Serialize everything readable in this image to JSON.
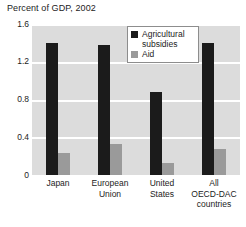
{
  "chart_data": {
    "type": "bar",
    "title": "Percent of GDP, 2002",
    "xlabel": "",
    "ylabel": "",
    "ylim": [
      0,
      1.6
    ],
    "yticks": [
      "0",
      "0.4",
      "0.8",
      "1.2",
      "1.6"
    ],
    "ytick_values": [
      0,
      0.4,
      0.8,
      1.2,
      1.6
    ],
    "grid": true,
    "legend_position": "top-right-inside",
    "categories": [
      "Japan",
      "European\nUnion",
      "United\nStates",
      "All\nOECD-DAC\ncountries"
    ],
    "series": [
      {
        "name": "Agricultural subsidies",
        "color": "#1b1b1b",
        "values": [
          1.4,
          1.38,
          0.88,
          1.4
        ]
      },
      {
        "name": "Aid",
        "color": "#9a9a9a",
        "values": [
          0.23,
          0.33,
          0.13,
          0.28
        ]
      }
    ]
  },
  "title": {
    "text": "Percent of GDP, 2002"
  },
  "axes": {
    "y": {
      "ticks": [
        {
          "label": "1.6",
          "value": 1.6
        },
        {
          "label": "1.2",
          "value": 1.2
        },
        {
          "label": "0.8",
          "value": 0.8
        },
        {
          "label": "0.4",
          "value": 0.4
        },
        {
          "label": "0",
          "value": 0
        }
      ]
    },
    "x": {
      "categories": [
        {
          "lines": [
            "Japan"
          ]
        },
        {
          "lines": [
            "European",
            "Union"
          ]
        },
        {
          "lines": [
            "United",
            "States"
          ]
        },
        {
          "lines": [
            "All",
            "OECD-DAC",
            "countries"
          ]
        }
      ]
    }
  },
  "legend": {
    "items": [
      {
        "label": "Agricultural subsidies",
        "color": "#1b1b1b",
        "swatch": "legend-swatch-dark"
      },
      {
        "label": "Aid",
        "color": "#9a9a9a",
        "swatch": "legend-swatch-gray"
      }
    ]
  },
  "colors": {
    "plot_background": "#dcdcdc",
    "gridline": "#ffffff",
    "page_background": "#ffffff",
    "text": "#1c1c1c",
    "subsidies": "#1b1b1b",
    "aid": "#9a9a9a"
  }
}
